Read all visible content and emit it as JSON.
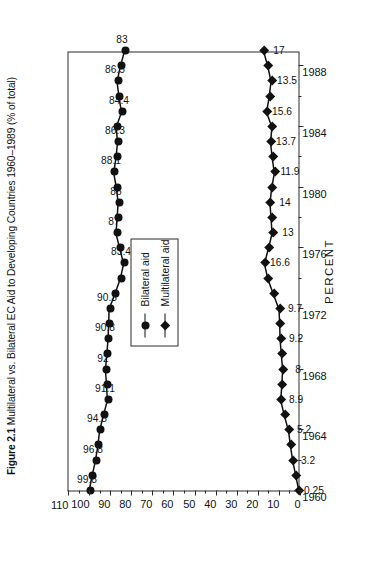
{
  "figure": {
    "number": "Figure 2.1",
    "title": "Multilateral vs. Bilateral EC Aid to Developing Countries 1960–1989 (% of total)"
  },
  "legend": {
    "position": "center",
    "items": [
      {
        "label": "Bilateral aid",
        "marker": "circle"
      },
      {
        "label": "Multilateral aid",
        "marker": "diamond"
      }
    ]
  },
  "axes": {
    "value_axis_title": "PERCENT",
    "value_ticks": [
      "110",
      "100",
      "90",
      "80",
      "70",
      "60",
      "50",
      "40",
      "30",
      "20",
      "10",
      "0"
    ],
    "year_ticks": [
      "1960",
      "1964",
      "1968",
      "1972",
      "1976",
      "1980",
      "1984",
      "1988"
    ]
  },
  "chart_data": {
    "type": "line",
    "title": "Figure 2.1 Multilateral vs. Bilateral EC Aid to Developing Countries 1960–1989 (% of total)",
    "xlabel": "",
    "ylabel": "PERCENT",
    "ylim": [
      0,
      110
    ],
    "xlim": [
      1960,
      1989
    ],
    "grid": false,
    "legend_position": "center",
    "orientation": "rotated-90-ccw",
    "x": [
      1960,
      1961,
      1962,
      1963,
      1964,
      1965,
      1966,
      1967,
      1968,
      1969,
      1970,
      1971,
      1972,
      1973,
      1974,
      1975,
      1976,
      1977,
      1978,
      1979,
      1980,
      1981,
      1982,
      1983,
      1984,
      1985,
      1986,
      1987,
      1988,
      1989
    ],
    "series": [
      {
        "name": "Bilateral aid",
        "marker": "circle",
        "values": [
          99.8,
          98.4,
          96.8,
          95.6,
          94.8,
          93.0,
          91.1,
          91.5,
          92.0,
          91.4,
          90.8,
          90.5,
          90.3,
          87.6,
          85.0,
          83.4,
          85.2,
          87.0,
          86.5,
          86.0,
          86.8,
          88.1,
          87.0,
          86.3,
          86.9,
          84.4,
          85.6,
          86.5,
          85.0,
          83.0
        ],
        "labeled_points": [
          {
            "x": 1960,
            "value": 99.8,
            "label": "99.8"
          },
          {
            "x": 1962,
            "value": 96.8,
            "label": "96.8"
          },
          {
            "x": 1964,
            "value": 94.8,
            "label": "94.8"
          },
          {
            "x": 1966,
            "value": 91.1,
            "label": "91.1"
          },
          {
            "x": 1968,
            "value": 92.0,
            "label": "92"
          },
          {
            "x": 1970,
            "value": 90.8,
            "label": "90.8"
          },
          {
            "x": 1972,
            "value": 90.3,
            "label": "90.3"
          },
          {
            "x": 1975,
            "value": 83.4,
            "label": "83.4"
          },
          {
            "x": 1977,
            "value": 87.0,
            "label": "87"
          },
          {
            "x": 1979,
            "value": 86.0,
            "label": "86"
          },
          {
            "x": 1981,
            "value": 88.1,
            "label": "88.1"
          },
          {
            "x": 1983,
            "value": 86.3,
            "label": "86.3"
          },
          {
            "x": 1985,
            "value": 84.4,
            "label": "84.4"
          },
          {
            "x": 1987,
            "value": 86.5,
            "label": "86.5"
          },
          {
            "x": 1989,
            "value": 83.0,
            "label": "83"
          }
        ]
      },
      {
        "name": "Multilateral aid",
        "marker": "diamond",
        "values": [
          0.25,
          1.7,
          3.2,
          4.3,
          5.2,
          7.2,
          8.9,
          8.4,
          8.0,
          8.6,
          9.2,
          9.4,
          9.7,
          12.4,
          15.0,
          16.6,
          14.8,
          13.0,
          13.5,
          14.0,
          13.2,
          11.9,
          13.0,
          13.7,
          13.1,
          15.6,
          14.4,
          13.5,
          15.0,
          17.0
        ],
        "labeled_points": [
          {
            "x": 1960,
            "value": 0.25,
            "label": "0.25"
          },
          {
            "x": 1962,
            "value": 3.2,
            "label": "3.2"
          },
          {
            "x": 1964,
            "value": 5.2,
            "label": "5.2"
          },
          {
            "x": 1966,
            "value": 8.9,
            "label": "8.9"
          },
          {
            "x": 1968,
            "value": 8.0,
            "label": "8"
          },
          {
            "x": 1970,
            "value": 9.2,
            "label": "9.2"
          },
          {
            "x": 1972,
            "value": 9.7,
            "label": "9.7"
          },
          {
            "x": 1975,
            "value": 16.6,
            "label": "16.6"
          },
          {
            "x": 1977,
            "value": 13.0,
            "label": "13"
          },
          {
            "x": 1979,
            "value": 14.0,
            "label": "14"
          },
          {
            "x": 1981,
            "value": 11.9,
            "label": "11.9"
          },
          {
            "x": 1983,
            "value": 13.7,
            "label": "13.7"
          },
          {
            "x": 1985,
            "value": 15.6,
            "label": "15.6"
          },
          {
            "x": 1987,
            "value": 13.5,
            "label": "13.5"
          },
          {
            "x": 1989,
            "value": 17.0,
            "label": "17"
          }
        ]
      }
    ]
  }
}
